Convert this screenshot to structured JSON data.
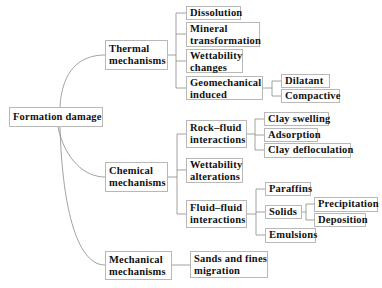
{
  "root": {
    "label": "Formation damage"
  },
  "branches": {
    "thermal": {
      "label": "Thermal mechanisms",
      "line1": "Thermal",
      "line2": "mechanisms",
      "children": {
        "dissolution": "Dissolution",
        "mineral_transformation": {
          "line1": "Mineral",
          "line2": "transformation"
        },
        "wettability_changes": {
          "line1": "Wettability",
          "line2": "changes"
        },
        "geomechanical_induced": {
          "line1": "Geomechanical",
          "line2": "induced",
          "children": {
            "dilatant": "Dilatant",
            "compactive": "Compactive"
          }
        }
      }
    },
    "chemical": {
      "label": "Chemical mechanisms",
      "line1": "Chemical",
      "line2": "mechanisms",
      "children": {
        "rock_fluid": {
          "line1": "Rock–fluid",
          "line2": "interactions",
          "children": {
            "clay_swelling": "Clay swelling",
            "adsorption": "Adsorption",
            "clay_defloculation": "Clay defloculation"
          }
        },
        "wettability_alterations": {
          "line1": "Wettability",
          "line2": "alterations"
        },
        "fluid_fluid": {
          "line1": "Fluid–fluid",
          "line2": "interactions",
          "children": {
            "paraffins": "Paraffins",
            "solids": {
              "label": "Solids",
              "children": {
                "precipitation": "Precipitation",
                "deposition": "Deposition"
              }
            },
            "emulsions": "Emulsions"
          }
        }
      }
    },
    "mechanical": {
      "label": "Mechanical mechanisms",
      "line1": "Mechanical",
      "line2": "mechanisms",
      "children": {
        "sands_fines": {
          "line1": "Sands and fines",
          "line2": "migration"
        }
      }
    }
  },
  "colors": {
    "line": "#8a8a8a",
    "border": "#b8b8b8",
    "text": "#111111"
  }
}
